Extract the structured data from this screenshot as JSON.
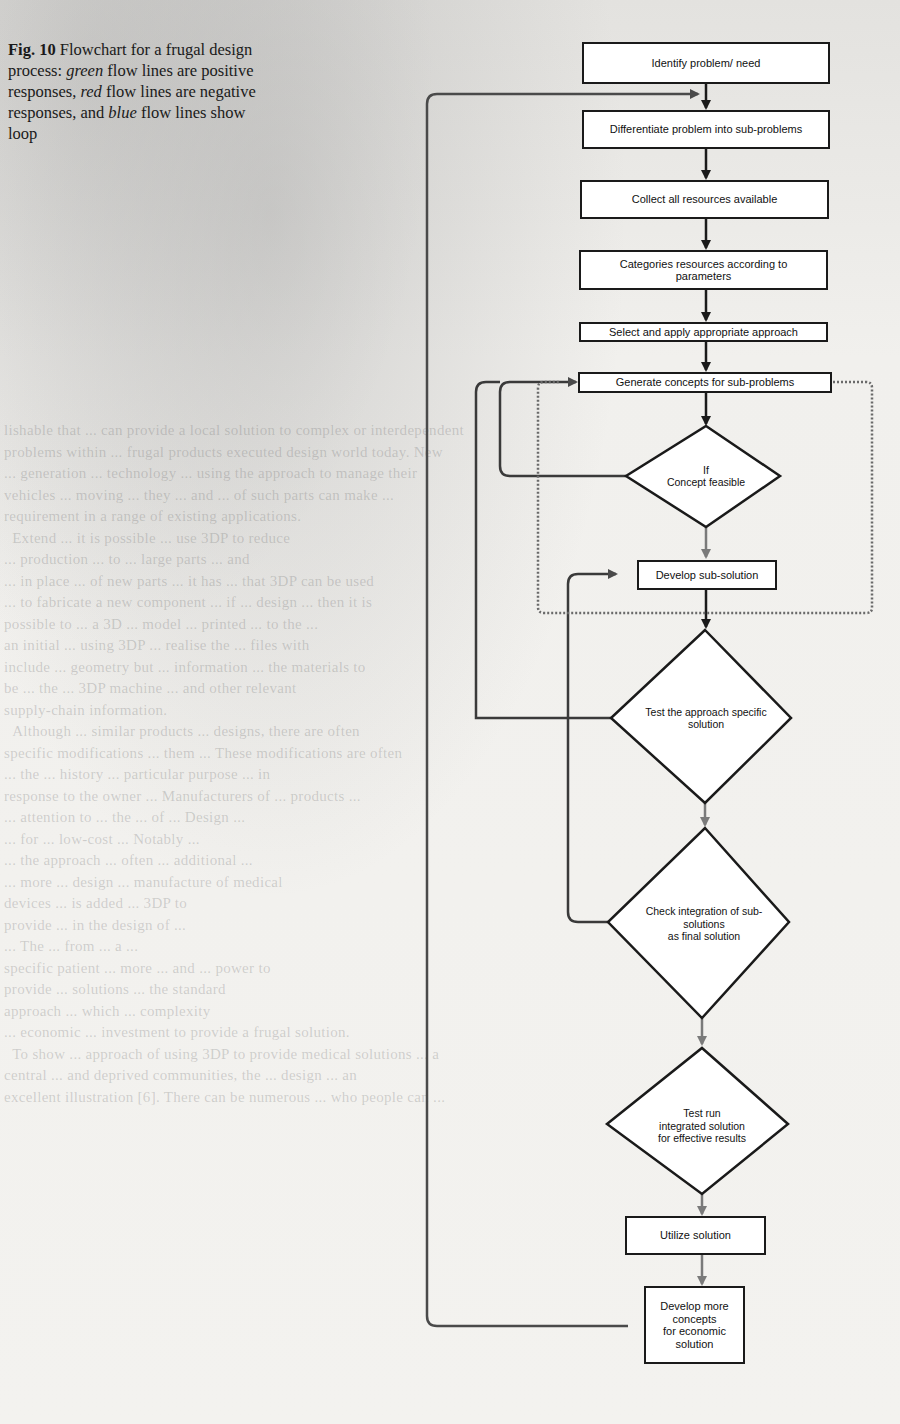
{
  "caption": {
    "label": "Fig. 10",
    "text_1": " Flowchart for a frugal design process: ",
    "green": "green",
    "text_2": " flow lines are positive responses, ",
    "red": "red",
    "text_3": " flow lines are negative responses, and ",
    "blue": "blue",
    "text_4": " flow lines show loop"
  },
  "flowchart": {
    "nodes": [
      {
        "id": "n1",
        "type": "process",
        "label": "Identify problem/ need"
      },
      {
        "id": "n2",
        "type": "process",
        "label": "Differentiate problem into sub-problems"
      },
      {
        "id": "n3",
        "type": "process",
        "label": "Collect all resources available"
      },
      {
        "id": "n4",
        "type": "process",
        "label": "Categories resources according to\nparameters"
      },
      {
        "id": "n5",
        "type": "process",
        "label": "Select and apply appropriate approach"
      },
      {
        "id": "n6",
        "type": "process",
        "label": "Generate concepts for sub-problems"
      },
      {
        "id": "d1",
        "type": "decision",
        "label": "If\nConcept feasible"
      },
      {
        "id": "n7",
        "type": "process",
        "label": "Develop sub-solution"
      },
      {
        "id": "d2",
        "type": "decision",
        "label": "Test the approach specific\nsolution"
      },
      {
        "id": "d3",
        "type": "decision",
        "label": "Check integration of sub-\nsolutions\nas final solution"
      },
      {
        "id": "d4",
        "type": "decision",
        "label": "Test run\nintegrated solution\nfor effective results"
      },
      {
        "id": "n8",
        "type": "process",
        "label": "Utilize solution"
      },
      {
        "id": "n9",
        "type": "process",
        "label": "Develop more\nconcepts\nfor economic\nsolution"
      }
    ],
    "edges": [
      {
        "from": "n1",
        "to": "n2",
        "kind": "flow"
      },
      {
        "from": "n2",
        "to": "n3",
        "kind": "flow"
      },
      {
        "from": "n3",
        "to": "n4",
        "kind": "flow"
      },
      {
        "from": "n4",
        "to": "n5",
        "kind": "flow"
      },
      {
        "from": "n5",
        "to": "n6",
        "kind": "flow"
      },
      {
        "from": "n6",
        "to": "d1",
        "kind": "flow"
      },
      {
        "from": "d1",
        "to": "n7",
        "kind": "positive"
      },
      {
        "from": "d1",
        "to": "n6",
        "kind": "negative"
      },
      {
        "from": "n7",
        "to": "d2",
        "kind": "flow"
      },
      {
        "from": "d2",
        "to": "n6",
        "kind": "negative"
      },
      {
        "from": "d2",
        "to": "d3",
        "kind": "positive"
      },
      {
        "from": "d3",
        "to": "n7",
        "kind": "negative"
      },
      {
        "from": "d3",
        "to": "d4",
        "kind": "positive"
      },
      {
        "from": "d4",
        "to": "n8",
        "kind": "positive"
      },
      {
        "from": "n8",
        "to": "n9",
        "kind": "positive"
      },
      {
        "from": "n9",
        "to": "n2",
        "kind": "loop"
      },
      {
        "from": "n6",
        "to": "n7",
        "kind": "loop-dotted"
      }
    ]
  },
  "colors": {
    "flow": "#1a1a1a",
    "positive": "#7a7a7a",
    "negative": "#3a3a3a",
    "loop": "#4a4a4a"
  }
}
